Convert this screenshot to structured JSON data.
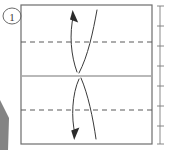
{
  "figure": {
    "kind": "origami-step-diagram",
    "step_label": "1",
    "caption": "",
    "background_color": "#ffffff",
    "ink_color": "#555555",
    "dark_ink_color": "#2b2b2b",
    "light_ink_color": "#9a9a9a"
  },
  "paper": {
    "name": "square-paper-sheet",
    "left": 21,
    "top": 5,
    "right": 152,
    "bottom": 144,
    "edge_color": "#6d6d6d",
    "edge_width": 1.2
  },
  "creases": [
    {
      "name": "upper-valley-crease",
      "style": "dashed",
      "y": 42,
      "color": "#5a5a5a",
      "dash": "5 4",
      "width": 1.1,
      "meaning": "valley fold line"
    },
    {
      "name": "center-horizontal-crease",
      "style": "solid",
      "y": 76,
      "color": "#a2a2a2",
      "dash": "",
      "width": 1.6,
      "meaning": "existing center fold"
    },
    {
      "name": "lower-valley-crease",
      "style": "dashed",
      "y": 110,
      "color": "#5a5a5a",
      "dash": "5 4",
      "width": 1.1,
      "meaning": "valley fold line"
    }
  ],
  "arrows": [
    {
      "name": "upper-fold-arrow",
      "direction": "up",
      "meaning": "fold top edge down to center, shown as upward rotation",
      "head_x": 73,
      "head_y": 11,
      "color": "#3a3a3a",
      "stroke_width": 1.0,
      "inner_path": "M 77 72 C 71 56, 69 34, 73.5 15",
      "outer_path": "M 97 10 C 93 32, 88 56, 79 73"
    },
    {
      "name": "lower-fold-arrow",
      "direction": "down",
      "meaning": "fold bottom edge up to center, shown as downward rotation",
      "head_x": 75,
      "head_y": 138,
      "color": "#3a3a3a",
      "stroke_width": 1.0,
      "inner_path": "M 79 79 C 72 94, 71 118, 75 134",
      "outer_path": "M 96 139 C 93 118, 88 94, 81 78"
    }
  ],
  "step_badge": {
    "name": "step-number-badge",
    "label": "1",
    "cx": 12,
    "cy": 16,
    "rx": 9,
    "ry": 8,
    "stroke_color": "#6a6a6a",
    "text_color": "#3a3a3a"
  },
  "ruler": {
    "name": "page-edge-ruler",
    "x": 160,
    "top": 6,
    "bottom": 144,
    "color": "#8a8a8a",
    "tick_color": "#7a7a7a",
    "tick_values": [
      "",
      "",
      "",
      "",
      "",
      "",
      ""
    ],
    "ticks_y": [
      6,
      26,
      46,
      66,
      86,
      106,
      126,
      144
    ]
  },
  "scan_artifact": {
    "name": "scan-edge-shadow",
    "points": "0,100 9,118 8,150 0,150",
    "color": "#6f6f6f"
  }
}
